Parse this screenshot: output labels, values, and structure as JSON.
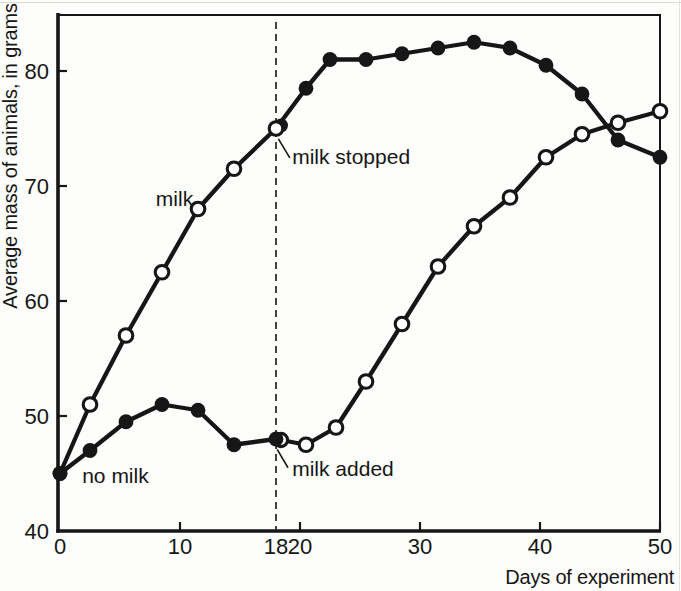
{
  "colors": {
    "ink": "#161616",
    "paper": "#fdfdfb"
  },
  "chart_data": {
    "type": "line",
    "title": "",
    "xlabel": "Days of experiment",
    "ylabel": "Average mass of animals, in grams",
    "xlim": [
      0,
      50
    ],
    "ylim": [
      40,
      85
    ],
    "grid": false,
    "legend": "none (curves labeled inline)",
    "marker_legend": {
      "open": "period receiving milk",
      "filled": "period without milk"
    },
    "xticks": [
      {
        "day": 0,
        "label": "0",
        "has_tick_mark": false
      },
      {
        "day": 10,
        "label": "10",
        "has_tick_mark": true
      },
      {
        "day": 18,
        "label": "18",
        "has_tick_mark": false
      },
      {
        "day": 20,
        "label": "20",
        "has_tick_mark": true
      },
      {
        "day": 30,
        "label": "30",
        "has_tick_mark": true
      },
      {
        "day": 40,
        "label": "40",
        "has_tick_mark": true
      },
      {
        "day": 50,
        "label": "50",
        "has_tick_mark": true
      }
    ],
    "yticks": [
      {
        "grams": 40,
        "label": "40",
        "has_tick_mark": false
      },
      {
        "grams": 50,
        "label": "50",
        "has_tick_mark": true
      },
      {
        "grams": 60,
        "label": "60",
        "has_tick_mark": true
      },
      {
        "grams": 70,
        "label": "70",
        "has_tick_mark": true
      },
      {
        "grams": 80,
        "label": "80",
        "has_tick_mark": true
      }
    ],
    "event_line": {
      "day": 18,
      "style": "dashed"
    },
    "series": [
      {
        "name": "milk group (milk until day 18, then stopped)",
        "points": [
          {
            "day": 0,
            "grams": 45,
            "marker": "filled"
          },
          {
            "day": 2.5,
            "grams": 51,
            "marker": "open"
          },
          {
            "day": 5.5,
            "grams": 57,
            "marker": "open"
          },
          {
            "day": 8.5,
            "grams": 62.5,
            "marker": "open"
          },
          {
            "day": 11.5,
            "grams": 68,
            "marker": "open"
          },
          {
            "day": 14.5,
            "grams": 71.5,
            "marker": "open"
          },
          {
            "day": 18,
            "grams": 75,
            "marker": "open-on-filled"
          },
          {
            "day": 20.5,
            "grams": 78.5,
            "marker": "filled"
          },
          {
            "day": 22.5,
            "grams": 81,
            "marker": "filled"
          },
          {
            "day": 25.5,
            "grams": 81,
            "marker": "filled"
          },
          {
            "day": 28.5,
            "grams": 81.5,
            "marker": "filled"
          },
          {
            "day": 31.5,
            "grams": 82,
            "marker": "filled"
          },
          {
            "day": 34.5,
            "grams": 82.5,
            "marker": "filled"
          },
          {
            "day": 37.5,
            "grams": 82,
            "marker": "filled"
          },
          {
            "day": 40.5,
            "grams": 80.5,
            "marker": "filled"
          },
          {
            "day": 43.5,
            "grams": 78,
            "marker": "filled"
          },
          {
            "day": 46.5,
            "grams": 74,
            "marker": "filled"
          },
          {
            "day": 50,
            "grams": 72.5,
            "marker": "filled"
          }
        ]
      },
      {
        "name": "no-milk group (milk added at day 18)",
        "points": [
          {
            "day": 0,
            "grams": 45,
            "marker": "filled"
          },
          {
            "day": 2.5,
            "grams": 47,
            "marker": "filled"
          },
          {
            "day": 5.5,
            "grams": 49.5,
            "marker": "filled"
          },
          {
            "day": 8.5,
            "grams": 51,
            "marker": "filled"
          },
          {
            "day": 11.5,
            "grams": 50.5,
            "marker": "filled"
          },
          {
            "day": 14.5,
            "grams": 47.5,
            "marker": "filled"
          },
          {
            "day": 18,
            "grams": 48,
            "marker": "filled-on-open"
          },
          {
            "day": 20.5,
            "grams": 47.5,
            "marker": "open"
          },
          {
            "day": 23,
            "grams": 49,
            "marker": "open"
          },
          {
            "day": 25.5,
            "grams": 53,
            "marker": "open"
          },
          {
            "day": 28.5,
            "grams": 58,
            "marker": "open"
          },
          {
            "day": 31.5,
            "grams": 63,
            "marker": "open"
          },
          {
            "day": 34.5,
            "grams": 66.5,
            "marker": "open"
          },
          {
            "day": 37.5,
            "grams": 69,
            "marker": "open"
          },
          {
            "day": 40.5,
            "grams": 72.5,
            "marker": "open"
          },
          {
            "day": 43.5,
            "grams": 74.5,
            "marker": "open"
          },
          {
            "day": 46.5,
            "grams": 75.5,
            "marker": "open"
          },
          {
            "day": 50,
            "grams": 76.5,
            "marker": "open"
          }
        ]
      }
    ],
    "annotations": {
      "milk_label": {
        "text": "milk",
        "day": 11.1,
        "grams": 68.3,
        "anchor": "end"
      },
      "no_milk_label": {
        "text": "no milk",
        "day": 1.85,
        "grams": 44.2,
        "anchor": "start"
      },
      "milk_stopped": {
        "text": "milk stopped",
        "day": 19.35,
        "grams": 71.9,
        "anchor": "start",
        "leader": {
          "from": [
            18.2,
            74.1
          ],
          "to": [
            19.15,
            72.45
          ]
        }
      },
      "milk_added": {
        "text": "milk added",
        "day": 19.35,
        "grams": 44.8,
        "anchor": "start",
        "leader": {
          "from": [
            18.1,
            47.1
          ],
          "to": [
            19.0,
            45.5
          ]
        }
      }
    }
  }
}
